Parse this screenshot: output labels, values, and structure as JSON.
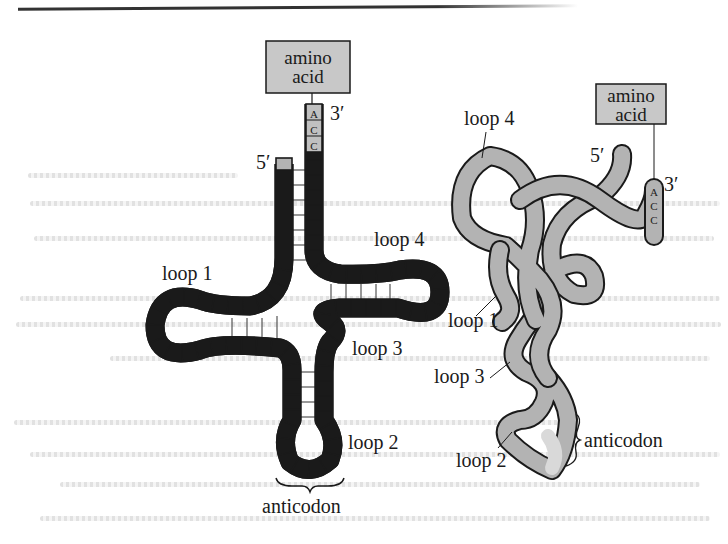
{
  "figure": {
    "cloverleaf": {
      "amino_acid_box": {
        "line1": "amino",
        "line2": "acid"
      },
      "three_prime": "3′",
      "five_prime": "5′",
      "acceptor_bases": [
        "A",
        "C",
        "C"
      ],
      "labels": {
        "loop1": "loop 1",
        "loop2": "loop 2",
        "loop3": "loop 3",
        "loop4": "loop 4",
        "anticodon": "anticodon"
      }
    },
    "tertiary": {
      "amino_acid_box": {
        "line1": "amino",
        "line2": "acid"
      },
      "three_prime": "3′",
      "five_prime": "5′",
      "acceptor_bases": [
        "A",
        "C",
        "C"
      ],
      "labels": {
        "loop1": "loop 1",
        "loop2": "loop 2",
        "loop3": "loop 3",
        "loop4": "loop 4",
        "anticodon": "anticodon"
      }
    },
    "colors": {
      "strand_fill": "#b3b3b3",
      "strand_outline": "#1a1a1a",
      "box_fill": "#c8c8c8",
      "anticodon_highlight": "#d9d9d9"
    }
  }
}
